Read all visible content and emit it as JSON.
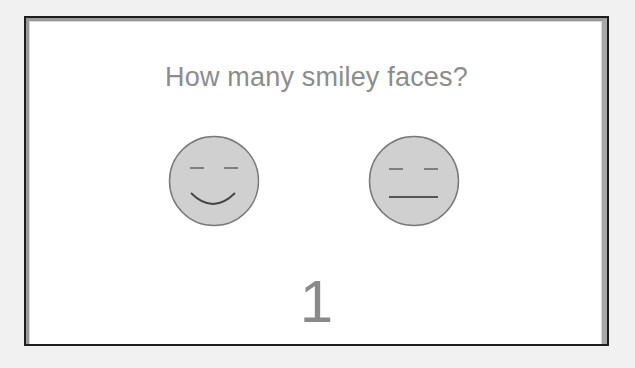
{
  "slide": {
    "question": "How many smiley faces?",
    "answer": "1"
  },
  "faces": [
    {
      "type": "smiling",
      "icon": "smiley-face-icon"
    },
    {
      "type": "neutral",
      "icon": "neutral-face-icon"
    }
  ],
  "colors": {
    "background": "#f1f1f1",
    "card": "#ffffff",
    "border_dark": "#1e1e1e",
    "border_grey": "#9a9a9a",
    "text": "#8c8c8c",
    "face_fill": "#d0d0d0",
    "face_stroke": "#6e6e6e"
  }
}
